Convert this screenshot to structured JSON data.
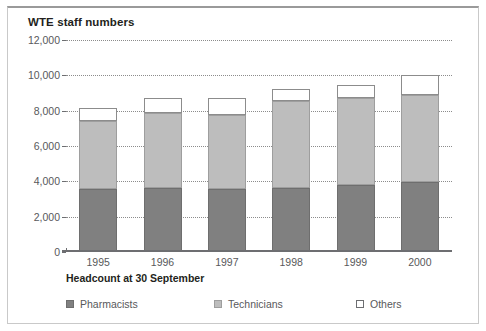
{
  "figure": {
    "title": "WTE staff numbers"
  },
  "chart_data": {
    "type": "bar",
    "subtype": "stacked-column",
    "title": "WTE staff numbers",
    "xlabel": "Headcount at 30 September",
    "ylabel": "",
    "categories": [
      "1995",
      "1996",
      "1997",
      "1998",
      "1999",
      "2000"
    ],
    "series": [
      {
        "name": "Pharmacists",
        "color": "#808080",
        "values": [
          3550,
          3600,
          3550,
          3650,
          3800,
          3950
        ]
      },
      {
        "name": "Technicians",
        "color": "#bdbdbd",
        "values": [
          3850,
          4250,
          4200,
          4900,
          4900,
          4950
        ]
      },
      {
        "name": "Others",
        "color": "#ffffff",
        "values": [
          750,
          850,
          950,
          650,
          750,
          1100
        ]
      }
    ],
    "totals": [
      8150,
      8700,
      8700,
      9200,
      9450,
      10000
    ],
    "ylim": [
      0,
      12000
    ],
    "ytick_values": [
      0,
      2000,
      4000,
      6000,
      8000,
      10000,
      12000
    ],
    "ytick_labels": [
      "0",
      "2,000",
      "4,000",
      "6,000",
      "8,000",
      "10,000",
      "12,000"
    ],
    "grid": true,
    "grid_style": "dotted",
    "legend_position": "bottom",
    "legend_entries": [
      "Pharmacists",
      "Technicians",
      "Others"
    ]
  },
  "axis": {
    "x_title": "Headcount at 30 September"
  },
  "legend": {
    "items": [
      {
        "label": "Pharmacists",
        "swatch": "swatch-pharmacists"
      },
      {
        "label": "Technicians",
        "swatch": "swatch-technicians"
      },
      {
        "label": "Others",
        "swatch": "swatch-others"
      }
    ]
  }
}
